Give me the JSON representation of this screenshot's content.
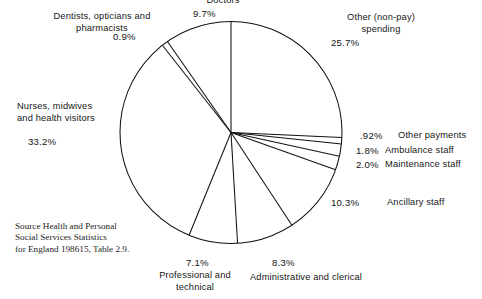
{
  "chart_data": {
    "type": "pie",
    "title": "",
    "subtitle": "",
    "xlabel": "",
    "ylabel": "",
    "legend_position": "callout-labels",
    "grid": false,
    "value_unit": "percent",
    "total": 100.0,
    "categories": [
      "Other (non-pay) spending",
      "Other payments",
      "Ambulance staff",
      "Maintenance staff",
      "Ancillary staff",
      "Administrative and clerical",
      "Professional and technical",
      "Nurses, midwives and health visitors",
      "Dentists, opticians and pharmacists",
      "Doctors"
    ],
    "values": [
      25.7,
      0.92,
      1.8,
      2.0,
      10.3,
      8.3,
      7.1,
      33.2,
      0.9,
      9.7
    ],
    "value_labels": [
      "25.7%",
      ".92%",
      "1.8%",
      "2.0%",
      "10.3%",
      "8.3%",
      "7.1%",
      "33.2%",
      "0.9%",
      "9.7%"
    ],
    "start_angle_deg": 0,
    "direction": "clockwise",
    "stroke_color": "#111111",
    "fill_color": "#ffffff"
  },
  "source_note": {
    "line1": "Source Health and Personal",
    "line2": "Social Services Statistics",
    "line3": "for England 198615, Table 2.9."
  },
  "labels": {
    "doctors": {
      "name": "Doctors",
      "pct": "9.7%"
    },
    "dentists": {
      "line1": "Dentists, opticians and",
      "line2": "pharmacists",
      "pct": "0.9%"
    },
    "nurses": {
      "line1": "Nurses, midwives",
      "line2": "and health visitors",
      "pct": "33.2%"
    },
    "other_nonpay": {
      "line1": "Other  (non-pay)",
      "line2": "spending",
      "pct": "25.7%"
    },
    "other_payments": {
      "name": "Other payments",
      "pct": ".92%"
    },
    "ambulance": {
      "name": "Ambulance staff",
      "pct": "1.8%"
    },
    "maintenance": {
      "name": "Maintenance staff",
      "pct": "2.0%"
    },
    "ancillary": {
      "name": "Ancillary staff",
      "pct": "10.3%"
    },
    "admin": {
      "name": "Administrative and clerical",
      "pct": "8.3%"
    },
    "professional": {
      "line1": "Professional and",
      "line2": "technical",
      "pct": "7.1%"
    }
  }
}
